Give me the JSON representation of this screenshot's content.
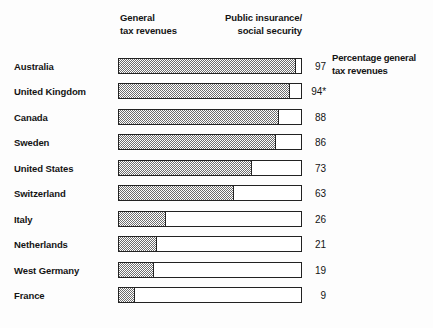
{
  "legend": {
    "left_label": "General\ntax revenues",
    "right_label": "Public insurance/\nsocial security"
  },
  "annotation": {
    "text": "Percentage general\ntax revenues"
  },
  "chart_data": {
    "type": "bar",
    "orientation": "horizontal",
    "stacked": true,
    "title": "",
    "subtitle": "",
    "xlabel": "",
    "ylabel": "",
    "xlim": [
      0,
      100
    ],
    "grid": false,
    "legend_position": "top",
    "legend_entries": [
      "General tax revenues",
      "Public insurance/social security"
    ],
    "annotation": "Percentage general tax revenues",
    "categories": [
      "Australia",
      "United Kingdom",
      "Canada",
      "Sweden",
      "United States",
      "Switzerland",
      "Italy",
      "Netherlands",
      "West Germany",
      "France"
    ],
    "values": [
      97,
      94,
      88,
      86,
      73,
      63,
      26,
      21,
      19,
      9
    ],
    "value_labels": [
      "97",
      "94*",
      "88",
      "86",
      "73",
      "63",
      "26",
      "21",
      "19",
      "9"
    ],
    "series": [
      {
        "name": "General tax revenues",
        "values": [
          97,
          94,
          88,
          86,
          73,
          63,
          26,
          21,
          19,
          9
        ]
      },
      {
        "name": "Public insurance/social security",
        "values": [
          3,
          6,
          12,
          14,
          27,
          37,
          74,
          79,
          81,
          91
        ]
      }
    ],
    "footnote_marker": "*",
    "colors": {
      "fill": "#6e6e6e",
      "empty": "#ffffff",
      "outline": "#222222",
      "text": "#141414",
      "background": "#fdfdfd"
    }
  },
  "rows": [
    {
      "country": "Australia",
      "value": 97,
      "label": "97"
    },
    {
      "country": "United Kingdom",
      "value": 94,
      "label": "94*"
    },
    {
      "country": "Canada",
      "value": 88,
      "label": "88"
    },
    {
      "country": "Sweden",
      "value": 86,
      "label": "86"
    },
    {
      "country": "United States",
      "value": 73,
      "label": "73"
    },
    {
      "country": "Switzerland",
      "value": 63,
      "label": "63"
    },
    {
      "country": "Italy",
      "value": 26,
      "label": "26"
    },
    {
      "country": "Netherlands",
      "value": 21,
      "label": "21"
    },
    {
      "country": "West Germany",
      "value": 19,
      "label": "19"
    },
    {
      "country": "France",
      "value": 9,
      "label": "9"
    }
  ]
}
